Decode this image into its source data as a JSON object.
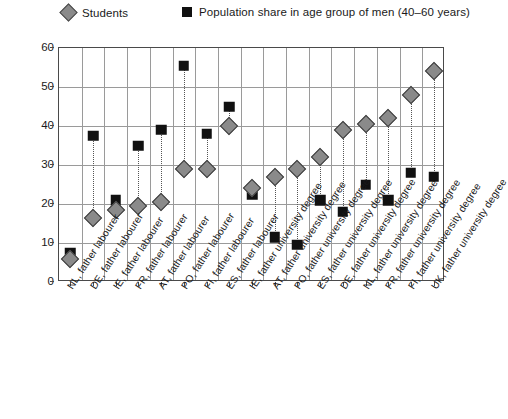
{
  "legend": {
    "items": [
      {
        "label": "Students",
        "marker": "diamond-marker",
        "color": "#8a8a8a"
      },
      {
        "label": "Population share in age group of men (40–60 years)",
        "marker": "square-marker",
        "color": "#111111"
      }
    ]
  },
  "axis": {
    "y_ticks": [
      "60",
      "50",
      "40",
      "30",
      "20",
      "10",
      "0"
    ]
  },
  "chart_data": {
    "type": "scatter",
    "title": "",
    "xlabel": "",
    "ylabel": "",
    "ylim": [
      0,
      60
    ],
    "ytick_values": [
      0,
      10,
      20,
      30,
      40,
      50,
      60
    ],
    "grid": true,
    "legend_position": "top",
    "categories": [
      "NL, father labourer",
      "DE, father labourer",
      "IE, father labourer",
      "FR, father labourer",
      "AT, father labourer",
      "PO, father labourer",
      "FI, father labourer",
      "ES, father labourer",
      "IE, father university degree",
      "AT, father university degree",
      "PO, father university degree",
      "ES, father university degree",
      "DE, father university degree",
      "NL, father university degree",
      "FR, father university degree",
      "FI, father university degree",
      "UK, father university degree"
    ],
    "series": [
      {
        "name": "Students",
        "marker": "diamond",
        "color": "#8a8a8a",
        "values": [
          6,
          16.5,
          18.5,
          19.5,
          20.5,
          29,
          29,
          40,
          24,
          27,
          29,
          32,
          39,
          40.5,
          42,
          48,
          54
        ]
      },
      {
        "name": "Population share in age group of men (40–60 years)",
        "marker": "square",
        "color": "#111111",
        "values": [
          7.5,
          37.5,
          21,
          35,
          39,
          55.5,
          38,
          45,
          22.5,
          11.5,
          9.5,
          21,
          18,
          25,
          21,
          28,
          27
        ]
      }
    ]
  }
}
